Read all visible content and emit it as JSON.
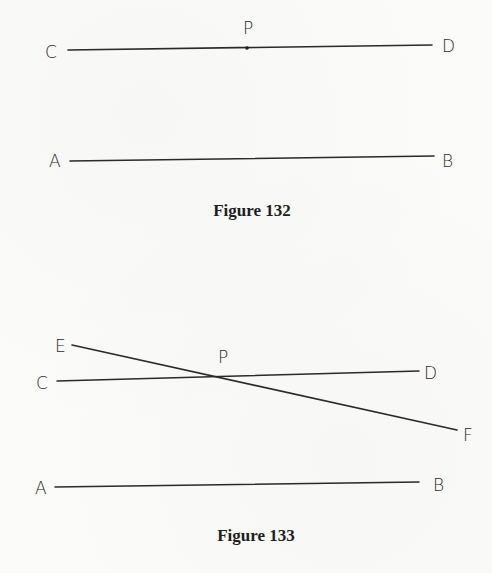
{
  "figures": [
    {
      "caption": "Figure 132",
      "caption_pos": {
        "x": 252,
        "y": 216
      },
      "segments": [
        {
          "name": "line-CD",
          "from": "C",
          "to": "D",
          "x1": 68,
          "y1": 50,
          "x2": 432,
          "y2": 45
        },
        {
          "name": "line-AB",
          "from": "A",
          "to": "B",
          "x1": 70,
          "y1": 161,
          "x2": 434,
          "y2": 156
        }
      ],
      "points": [
        {
          "label": "C",
          "x": 45,
          "y": 58
        },
        {
          "label": "D",
          "x": 442,
          "y": 52
        },
        {
          "label": "P",
          "x": 243,
          "y": 34
        },
        {
          "label": "A",
          "x": 49,
          "y": 167
        },
        {
          "label": "B",
          "x": 442,
          "y": 167
        }
      ],
      "marked_point": {
        "label": "P",
        "x": 247,
        "y": 48
      }
    },
    {
      "caption": "Figure 133",
      "caption_pos": {
        "x": 256,
        "y": 541
      },
      "segments": [
        {
          "name": "line-EF",
          "from": "E",
          "to": "F",
          "x1": 72,
          "y1": 345,
          "x2": 457,
          "y2": 430
        },
        {
          "name": "line-CD",
          "from": "C",
          "to": "D",
          "x1": 57,
          "y1": 381,
          "x2": 419,
          "y2": 371
        },
        {
          "name": "line-AB",
          "from": "A",
          "to": "B",
          "x1": 55,
          "y1": 487,
          "x2": 419,
          "y2": 482
        }
      ],
      "points": [
        {
          "label": "E",
          "x": 55,
          "y": 352
        },
        {
          "label": "C",
          "x": 36,
          "y": 389
        },
        {
          "label": "P",
          "x": 218,
          "y": 363
        },
        {
          "label": "D",
          "x": 424,
          "y": 379
        },
        {
          "label": "F",
          "x": 463,
          "y": 441
        },
        {
          "label": "A",
          "x": 35,
          "y": 494
        },
        {
          "label": "B",
          "x": 433,
          "y": 491
        }
      ],
      "intersection": {
        "label": "P",
        "x": 220,
        "y": 376
      }
    }
  ]
}
